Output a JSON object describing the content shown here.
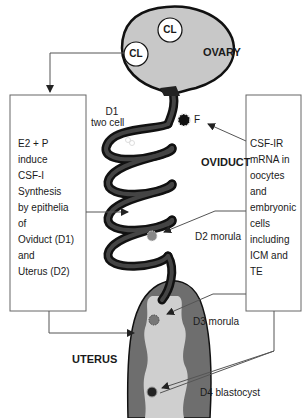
{
  "figure": {
    "organs": {
      "ovary": "OVARY",
      "oviduct": "OVIDUCT",
      "uterus": "UTERUS"
    },
    "ovary_structures": [
      "CL",
      "CL"
    ],
    "embryo_stages": {
      "d1": [
        "D1",
        "two cell"
      ],
      "fertilization": "F",
      "d2": "D2 morula",
      "d3": "D3 morula",
      "d4": "D4 blastocyst"
    },
    "left_box": {
      "lines": [
        "E2 + P",
        "induce",
        "CSF-I",
        "Synthesis",
        "by epithelia",
        "of",
        "Oviduct (D1)",
        "and",
        "Uterus (D2)"
      ]
    },
    "right_box": {
      "lines": [
        "CSF-IR",
        "mRNA in",
        "oocytes",
        "and",
        "embryonic",
        "cells",
        "including",
        "ICM and",
        "TE"
      ]
    },
    "colors": {
      "ovary_fill": "#c8c8c8",
      "tube": "#2a2a2a",
      "uterus_wall": "#6e6e6e",
      "uterus_lumen": "#cfcfcf",
      "line": "#555555"
    }
  }
}
